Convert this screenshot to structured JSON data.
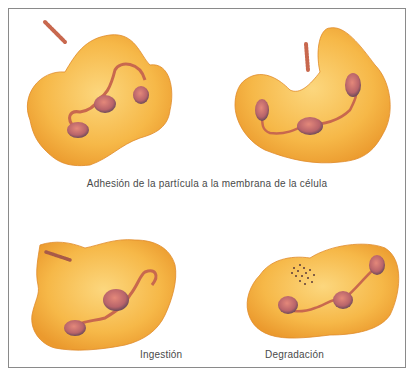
{
  "figure": {
    "captions": {
      "adhesion": "Adhesión de la partícula a la membrana de la célula",
      "ingestion": "Ingestión",
      "degradation": "Degradación"
    },
    "panels": [
      {
        "id": "adhesion-1",
        "description": "Cell with pseudopod extending toward a rod-shaped particle"
      },
      {
        "id": "adhesion-2",
        "description": "Crescent-shaped cell wrapping toward a rod-shaped particle"
      },
      {
        "id": "ingestion",
        "description": "Particle engulfed inside the cell"
      },
      {
        "id": "degradation",
        "description": "Particle fragmented into dots inside the cell"
      }
    ],
    "colors": {
      "cell_fill": "#f5b444",
      "cell_light": "#fbd57a",
      "cell_edge": "#e08a2a",
      "nucleus_fill": "#d9786a",
      "nucleus_dark": "#6d4a5a",
      "particle": "#c8684e",
      "frame": "#8a8a8a",
      "caption": "#4a4a4a"
    }
  }
}
